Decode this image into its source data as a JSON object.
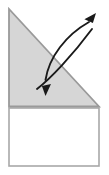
{
  "figure": {
    "canvas": {
      "width": 109,
      "height": 175
    },
    "background_color": "#ffffff",
    "shapes": {
      "folded_flap": {
        "name": "triangle-flap",
        "kind": "right-triangle",
        "fill_color": "#d6d6d6",
        "stroke_color": "#9a9a9a",
        "stroke_width": 2,
        "points": "8,8 8,107 100,107",
        "vertices": [
          {
            "label": "top-left",
            "x": 8,
            "y": 8
          },
          {
            "label": "bottom-left",
            "x": 8,
            "y": 107
          },
          {
            "label": "bottom-right",
            "x": 100,
            "y": 107
          }
        ]
      },
      "base_sheet": {
        "name": "rectangle-base",
        "kind": "rectangle",
        "fill_color": "#ffffff",
        "stroke_color": "#a8a8a8",
        "stroke_width": 2,
        "x": 8,
        "y": 107,
        "width": 92,
        "height": 60
      }
    },
    "arrows": [
      {
        "name": "unfold-arrow-up-right",
        "direction": "up-right",
        "color": "#1a1a1a",
        "stroke_width": 2,
        "path": "M 37,88 C 52,76 74,52 94,28",
        "head": {
          "x": 96,
          "y": 14,
          "angle_deg": -42,
          "size": 11
        }
      },
      {
        "name": "fold-arrow-down",
        "direction": "down",
        "color": "#1a1a1a",
        "stroke_width": 2,
        "path": "M 88,21 C 66,34 48,58 45,81",
        "head": {
          "x": 45,
          "y": 96,
          "angle_deg": 96,
          "size": 11
        }
      }
    ]
  }
}
